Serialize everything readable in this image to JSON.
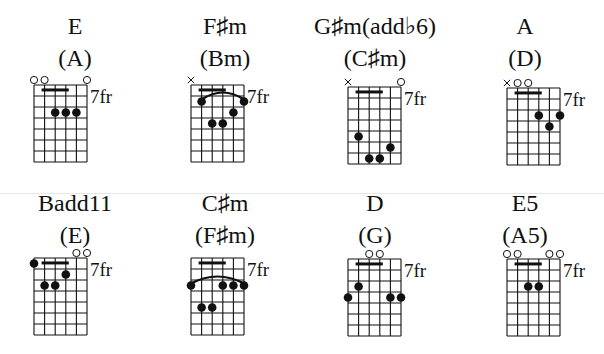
{
  "layout": {
    "strings": 6,
    "frets": 7,
    "string_spacing": 10.6,
    "fret_spacing": 11,
    "fret_label": "7fr"
  },
  "colors": {
    "ink": "#111111",
    "separator": "#e6e6e6"
  },
  "chords": [
    {
      "name": "E",
      "capo_name": "(A)",
      "pos": {
        "x": 0,
        "y": 0
      },
      "grid": {
        "x": 34,
        "y": 85
      },
      "fret_label": "7fr",
      "open": [
        1,
        2,
        6
      ],
      "muted": [],
      "barre": {
        "from": 2,
        "to": 4,
        "fret": 1
      },
      "arc": null,
      "dots": [
        {
          "s": 3,
          "f": 3
        },
        {
          "s": 4,
          "f": 3
        },
        {
          "s": 5,
          "f": 3
        }
      ]
    },
    {
      "name": "F♯m",
      "capo_name": "(Bm)",
      "pos": {
        "x": 150,
        "y": 0
      },
      "grid": {
        "x": 191,
        "y": 85
      },
      "fret_label": "7fr",
      "open": [],
      "muted": [
        1
      ],
      "barre": {
        "from": 2,
        "to": 4,
        "fret": 1
      },
      "arc": {
        "from": 2,
        "to": 6,
        "fret": 2
      },
      "dots": [
        {
          "s": 2,
          "f": 2
        },
        {
          "s": 6,
          "f": 2
        },
        {
          "s": 5,
          "f": 3
        },
        {
          "s": 3,
          "f": 4
        },
        {
          "s": 4,
          "f": 4
        }
      ]
    },
    {
      "name": "G♯m(add♭6)",
      "capo_name": "(C♯m)",
      "pos": {
        "x": 300,
        "y": 0
      },
      "grid": {
        "x": 348,
        "y": 87
      },
      "fret_label": "7fr",
      "open": [
        6
      ],
      "muted": [
        1
      ],
      "barre": {
        "from": 2,
        "to": 4,
        "fret": 1
      },
      "arc": null,
      "dots": [
        {
          "s": 2,
          "f": 5
        },
        {
          "s": 5,
          "f": 6
        },
        {
          "s": 3,
          "f": 7
        },
        {
          "s": 4,
          "f": 7
        }
      ]
    },
    {
      "name": "A",
      "capo_name": "(D)",
      "pos": {
        "x": 450,
        "y": 0
      },
      "grid": {
        "x": 507,
        "y": 88
      },
      "fret_label": "7fr",
      "open": [
        2,
        3
      ],
      "muted": [
        1
      ],
      "barre": {
        "from": 2,
        "to": 4,
        "fret": 1
      },
      "arc": null,
      "dots": [
        {
          "s": 4,
          "f": 3
        },
        {
          "s": 6,
          "f": 3
        },
        {
          "s": 5,
          "f": 4
        }
      ]
    },
    {
      "name": "Badd11",
      "capo_name": "(E)",
      "pos": {
        "x": 0,
        "y": 177
      },
      "grid": {
        "x": 34,
        "y": 258
      },
      "fret_label": "7fr",
      "open": [
        5,
        6
      ],
      "muted": [],
      "barre": {
        "from": 2,
        "to": 4,
        "fret": 1
      },
      "arc": null,
      "dots": [
        {
          "s": 1,
          "f": 1
        },
        {
          "s": 4,
          "f": 2
        },
        {
          "s": 2,
          "f": 3
        },
        {
          "s": 3,
          "f": 3
        }
      ]
    },
    {
      "name": "C♯m",
      "capo_name": "(F♯m)",
      "pos": {
        "x": 150,
        "y": 177
      },
      "grid": {
        "x": 191,
        "y": 258
      },
      "fret_label": "7fr",
      "open": [],
      "muted": [],
      "barre": {
        "from": 2,
        "to": 4,
        "fret": 1
      },
      "arc": {
        "from": 1,
        "to": 6,
        "fret": 3
      },
      "dots": [
        {
          "s": 1,
          "f": 3
        },
        {
          "s": 4,
          "f": 3
        },
        {
          "s": 5,
          "f": 3
        },
        {
          "s": 6,
          "f": 3
        },
        {
          "s": 2,
          "f": 5
        },
        {
          "s": 3,
          "f": 5
        }
      ]
    },
    {
      "name": "D",
      "capo_name": "(G)",
      "pos": {
        "x": 300,
        "y": 177
      },
      "grid": {
        "x": 348,
        "y": 259
      },
      "fret_label": "7fr",
      "open": [
        3,
        4
      ],
      "muted": [],
      "barre": {
        "from": 2,
        "to": 4,
        "fret": 1
      },
      "arc": null,
      "dots": [
        {
          "s": 2,
          "f": 3
        },
        {
          "s": 1,
          "f": 4
        },
        {
          "s": 5,
          "f": 4
        },
        {
          "s": 6,
          "f": 4
        }
      ]
    },
    {
      "name": "E5",
      "capo_name": "(A5)",
      "pos": {
        "x": 450,
        "y": 177
      },
      "grid": {
        "x": 507,
        "y": 259
      },
      "fret_label": "7fr",
      "open": [
        1,
        2,
        5,
        6
      ],
      "muted": [],
      "barre": {
        "from": 2,
        "to": 4,
        "fret": 1
      },
      "arc": null,
      "dots": [
        {
          "s": 3,
          "f": 3
        },
        {
          "s": 4,
          "f": 3
        }
      ]
    }
  ]
}
